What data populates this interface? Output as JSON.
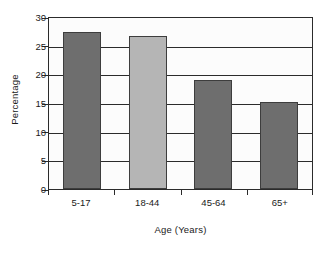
{
  "chart_data": {
    "type": "bar",
    "title": "",
    "subtitle": "",
    "categories": [
      "5-17",
      "18-44",
      "45-64",
      "65+"
    ],
    "values": [
      27.5,
      26.8,
      19.2,
      15.3
    ],
    "bar_colors": [
      "#6e6e6e",
      "#b5b5b5",
      "#6e6e6e",
      "#6e6e6e"
    ],
    "xlabel": "Age (Years)",
    "ylabel": "Percentage",
    "ylim": [
      0,
      30
    ],
    "yticks": [
      30,
      25,
      20,
      15,
      10,
      5,
      0
    ],
    "ytick_labels": [
      "30",
      "25",
      "20",
      "15",
      "10",
      "5",
      "0"
    ],
    "grid": "horizontal",
    "legend": "none",
    "annotations": []
  },
  "axis": {
    "frame_color": "#2b2b2b",
    "plot_background": "#fcfcfc"
  }
}
